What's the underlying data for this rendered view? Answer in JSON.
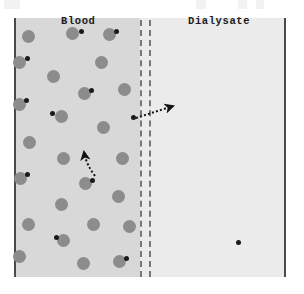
{
  "figure": {
    "name": "hemodialysis-diffusion-diagram",
    "compartments": {
      "left": {
        "label": "Blood",
        "fill_color": "#d8d8d8"
      },
      "right": {
        "label": "Dialysate",
        "fill_color": "#ebebeb"
      }
    },
    "membrane": {
      "name": "semipermeable-membrane",
      "style": "double dashed vertical line",
      "color": "#777777",
      "line_count": 2
    },
    "border_color": "#4a4a4a",
    "particles": {
      "cell_color": "#8c8c8c",
      "solute_color": "#1a1a1a",
      "cell_diameter_px": 13,
      "solute_diameter_px": 5,
      "cells": [
        {
          "x": 28,
          "y": 36,
          "solute": null
        },
        {
          "x": 72,
          "y": 33,
          "solute": {
            "x": 81,
            "y": 31
          }
        },
        {
          "x": 109,
          "y": 34,
          "solute": {
            "x": 116,
            "y": 31
          }
        },
        {
          "x": 19,
          "y": 62,
          "solute": {
            "x": 27,
            "y": 58
          }
        },
        {
          "x": 53,
          "y": 76,
          "solute": null
        },
        {
          "x": 101,
          "y": 62,
          "solute": null
        },
        {
          "x": 124,
          "y": 89,
          "solute": null
        },
        {
          "x": 84,
          "y": 93,
          "solute": {
            "x": 91,
            "y": 90
          }
        },
        {
          "x": 19,
          "y": 104,
          "solute": {
            "x": 26,
            "y": 100
          }
        },
        {
          "x": 61,
          "y": 116,
          "solute": {
            "x": 52,
            "y": 113
          }
        },
        {
          "x": 103,
          "y": 127,
          "solute": null
        },
        {
          "x": 29,
          "y": 142,
          "solute": null
        },
        {
          "x": 63,
          "y": 158,
          "solute": null
        },
        {
          "x": 122,
          "y": 158,
          "solute": null
        },
        {
          "x": 20,
          "y": 178,
          "solute": {
            "x": 27,
            "y": 174
          }
        },
        {
          "x": 85,
          "y": 183,
          "solute": {
            "x": 92,
            "y": 180
          }
        },
        {
          "x": 118,
          "y": 196,
          "solute": null
        },
        {
          "x": 61,
          "y": 204,
          "solute": null
        },
        {
          "x": 28,
          "y": 224,
          "solute": null
        },
        {
          "x": 93,
          "y": 224,
          "solute": null
        },
        {
          "x": 63,
          "y": 240,
          "solute": {
            "x": 56,
            "y": 237
          }
        },
        {
          "x": 129,
          "y": 226,
          "solute": null
        },
        {
          "x": 19,
          "y": 256,
          "solute": null
        },
        {
          "x": 83,
          "y": 263,
          "solute": null
        },
        {
          "x": 119,
          "y": 261,
          "solute": {
            "x": 126,
            "y": 258
          }
        }
      ],
      "free_solutes": [
        {
          "name": "solute-crossing-membrane",
          "x": 133,
          "y": 117
        },
        {
          "name": "solute-in-dialysate",
          "x": 238,
          "y": 242
        }
      ]
    },
    "arrows": [
      {
        "name": "diffusion-arrow-across-membrane",
        "style": "dotted",
        "from": {
          "x": 136,
          "y": 118
        },
        "to": {
          "x": 173,
          "y": 106
        },
        "direction": "blood-to-dialysate"
      },
      {
        "name": "diffusion-arrow-within-blood",
        "style": "dotted-curved",
        "from": {
          "x": 95,
          "y": 176
        },
        "to": {
          "x": 84,
          "y": 152
        },
        "direction": "upward-left"
      }
    ]
  }
}
